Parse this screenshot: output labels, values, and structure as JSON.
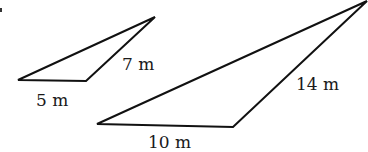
{
  "figure": {
    "small_triangle": {
      "vertices": [
        [
          18,
          80
        ],
        [
          86,
          81
        ],
        [
          155,
          17
        ]
      ],
      "sides": {
        "base": "5 m",
        "right": "7 m"
      }
    },
    "large_triangle": {
      "vertices": [
        [
          97,
          124
        ],
        [
          233,
          127
        ],
        [
          367,
          1
        ]
      ],
      "sides": {
        "base": "10 m",
        "right": "14 m"
      }
    },
    "colors": {
      "stroke": "#111111",
      "text": "#1a1a1a",
      "background": "#ffffff"
    }
  }
}
